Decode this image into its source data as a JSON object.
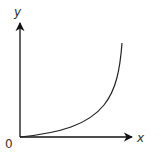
{
  "diagram": {
    "type": "function-graph",
    "axes": {
      "x_label": "x",
      "y_label": "y",
      "origin_label": "0"
    },
    "curve": {
      "shape": "convex increasing (exponential growth)",
      "start": "origin",
      "color": "#222222"
    },
    "colors": {
      "axis": "#111111",
      "curve": "#222222",
      "background": "#ffffff"
    }
  }
}
